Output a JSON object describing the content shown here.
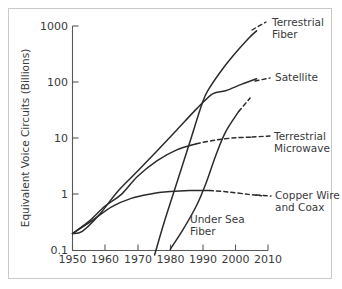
{
  "chart_data": {
    "type": "line",
    "title": "",
    "xlabel": "",
    "ylabel": "Equivalent Voice Circuits (Billions)",
    "x_ticks": [
      1950,
      1960,
      1970,
      1980,
      1990,
      2000,
      2010
    ],
    "x_tick_labels": [
      "1950",
      "1960",
      "1970",
      "1980",
      "1990",
      "2000",
      "2010"
    ],
    "y_ticks": [
      0.1,
      1,
      10,
      100,
      1000
    ],
    "y_tick_labels": [
      "0.1",
      "1",
      "10",
      "100",
      "1000"
    ],
    "xlim": [
      1950,
      2010
    ],
    "ylim": [
      0.1,
      1000
    ],
    "yscale": "log",
    "grid": false,
    "legend_position": "right-inline-labels",
    "series": [
      {
        "name": "Terrestrial Fiber",
        "label": "Terrestrial Fiber",
        "label_line1": "Terrestrial",
        "label_line2": "Fiber",
        "style": "solid",
        "points": [
          {
            "x": 1975.2,
            "y": 0.083
          },
          {
            "x": 1978,
            "y": 0.3
          },
          {
            "x": 1982,
            "y": 1.6
          },
          {
            "x": 1986,
            "y": 8.5
          },
          {
            "x": 1990,
            "y": 45
          },
          {
            "x": 1992,
            "y": 78
          },
          {
            "x": 1996,
            "y": 170
          },
          {
            "x": 2000,
            "y": 330
          },
          {
            "x": 2004,
            "y": 600
          },
          {
            "x": 2006.5,
            "y": 820
          }
        ]
      },
      {
        "name": "Satellite",
        "label": "Satellite",
        "style": "solid",
        "points": [
          {
            "x": 1950,
            "y": 0.2
          },
          {
            "x": 1953,
            "y": 0.22
          },
          {
            "x": 1958,
            "y": 0.42
          },
          {
            "x": 1964,
            "y": 1.15
          },
          {
            "x": 1970,
            "y": 2.6
          },
          {
            "x": 1976,
            "y": 6.0
          },
          {
            "x": 1982,
            "y": 14
          },
          {
            "x": 1988,
            "y": 33
          },
          {
            "x": 1993,
            "y": 62
          },
          {
            "x": 1997,
            "y": 70
          },
          {
            "x": 2002,
            "y": 92
          },
          {
            "x": 2006.5,
            "y": 115
          }
        ]
      },
      {
        "name": "Terrestrial Microwave",
        "label": "Terrestrial Microwave",
        "label_line1": "Terrestrial",
        "label_line2": "Microwave",
        "style": "solid-then-dashed",
        "dash_start_x": 1988,
        "points": [
          {
            "x": 1950,
            "y": 0.2
          },
          {
            "x": 1955,
            "y": 0.33
          },
          {
            "x": 1960,
            "y": 0.62
          },
          {
            "x": 1965,
            "y": 1.0
          },
          {
            "x": 1970,
            "y": 2.1
          },
          {
            "x": 1976,
            "y": 4.0
          },
          {
            "x": 1982,
            "y": 6.2
          },
          {
            "x": 1988,
            "y": 8.0
          },
          {
            "x": 1994,
            "y": 9.3
          },
          {
            "x": 2000,
            "y": 10.2
          },
          {
            "x": 2005,
            "y": 10.4
          }
        ]
      },
      {
        "name": "Copper Wire and Coax",
        "label": "Copper Wire and Coax",
        "label_line1": "Copper Wire",
        "label_line2": "and Coax",
        "style": "solid-then-dashed",
        "dash_start_x": 1992,
        "points": [
          {
            "x": 1950,
            "y": 0.2
          },
          {
            "x": 1956,
            "y": 0.34
          },
          {
            "x": 1962,
            "y": 0.6
          },
          {
            "x": 1968,
            "y": 0.85
          },
          {
            "x": 1974,
            "y": 1.02
          },
          {
            "x": 1980,
            "y": 1.12
          },
          {
            "x": 1986,
            "y": 1.17
          },
          {
            "x": 1992,
            "y": 1.17
          },
          {
            "x": 1998,
            "y": 1.1
          },
          {
            "x": 2004,
            "y": 1.0
          },
          {
            "x": 2008,
            "y": 0.95
          }
        ]
      },
      {
        "name": "Under Sea Fiber",
        "label": "Under Sea Fiber",
        "label_line1": "Under Sea",
        "label_line2": "Fiber",
        "style": "solid-then-dashed",
        "dash_start_x": 2001,
        "points": [
          {
            "x": 1980,
            "y": 0.105
          },
          {
            "x": 1984,
            "y": 0.24
          },
          {
            "x": 1988,
            "y": 0.62
          },
          {
            "x": 1991,
            "y": 1.6
          },
          {
            "x": 1994,
            "y": 5.0
          },
          {
            "x": 1997,
            "y": 13
          },
          {
            "x": 2001,
            "y": 30
          },
          {
            "x": 2004.5,
            "y": 52
          }
        ]
      }
    ]
  },
  "colors": {
    "line": "#2b2b2b",
    "axis": "#58585a",
    "text": "#3a3a3c",
    "frame": "#c9c9c9",
    "background": "#ffffff"
  }
}
